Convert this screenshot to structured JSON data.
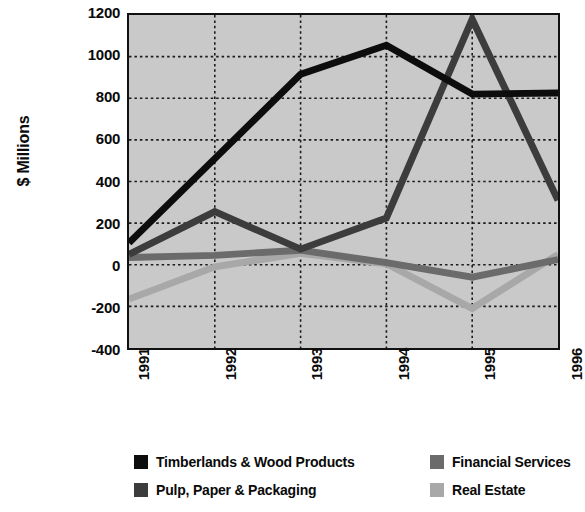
{
  "chart_data": {
    "type": "line",
    "title": "",
    "xlabel": "",
    "ylabel": "$ Millions",
    "categories": [
      "1991",
      "1992",
      "1993",
      "1994",
      "1995",
      "1996"
    ],
    "x": [
      1991,
      1992,
      1993,
      1994,
      1995,
      1996
    ],
    "ylim": [
      -400,
      1200
    ],
    "ytick_values": [
      1200,
      1000,
      800,
      600,
      400,
      200,
      0,
      -200,
      -400
    ],
    "ytick_labels": [
      "1200",
      "1000",
      "800",
      "600",
      "400",
      "200",
      "0",
      "-200",
      "-400"
    ],
    "grid": true,
    "grid_style": "dotted",
    "legend_position": "bottom",
    "plot_background": "#c9c9c9",
    "series": [
      {
        "name": "Timberlands & Wood Products",
        "color": "#0d0d0d",
        "values": [
          105,
          510,
          915,
          1055,
          820,
          825
        ]
      },
      {
        "name": "Pulp, Paper & Packaging",
        "color": "#3c3c3c",
        "values": [
          50,
          255,
          75,
          225,
          1180,
          310
        ]
      },
      {
        "name": "Financial Services",
        "color": "#6b6b6b",
        "values": [
          35,
          45,
          70,
          10,
          -60,
          25
        ]
      },
      {
        "name": "Real Estate",
        "color": "#a8a8a8",
        "values": [
          -165,
          -10,
          55,
          5,
          -210,
          50
        ]
      }
    ]
  },
  "legend": {
    "items": [
      {
        "label": "Timberlands & Wood Products",
        "color": "#0d0d0d"
      },
      {
        "label": "Pulp, Paper & Packaging",
        "color": "#3c3c3c"
      },
      {
        "label": "Financial Services",
        "color": "#6b6b6b"
      },
      {
        "label": "Real Estate",
        "color": "#a8a8a8"
      }
    ]
  }
}
